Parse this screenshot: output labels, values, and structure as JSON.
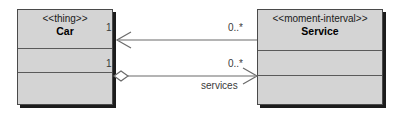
{
  "diagram": {
    "type": "uml-class-diagram",
    "background_color": "#ffffff",
    "class_fill_color": "#d4d4d4",
    "border_color": "#4a4a4a",
    "line_color": "#6b6b6b",
    "classes": [
      {
        "id": "car",
        "stereotype": "<<thing>>",
        "name": "Car",
        "compartments": [
          "",
          ""
        ]
      },
      {
        "id": "service",
        "stereotype": "<<moment-interval>>",
        "name": "Service",
        "compartments": [
          "",
          ""
        ]
      }
    ],
    "relationships": [
      {
        "id": "top-association",
        "kind": "association",
        "source": "Service",
        "target": "Car",
        "arrow": "open-arrow-left",
        "source_multiplicity": "0..*",
        "target_multiplicity": "1",
        "role": ""
      },
      {
        "id": "bottom-aggregation",
        "kind": "aggregation",
        "source": "Car",
        "target": "Service",
        "arrow": "open-arrow-right",
        "diamond": "hollow",
        "source_multiplicity": "1",
        "target_multiplicity": "0..*",
        "role": "services"
      }
    ]
  }
}
